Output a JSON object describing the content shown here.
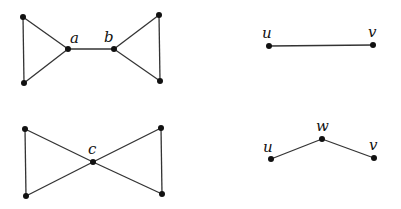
{
  "figure": {
    "graphs": [
      {
        "id": "bowtie-bridge",
        "labels": {
          "a": "a",
          "b": "b"
        }
      },
      {
        "id": "bowtie-cut",
        "labels": {
          "c": "c"
        }
      },
      {
        "id": "single-edge",
        "labels": {
          "u": "u",
          "v": "v"
        }
      },
      {
        "id": "path-two-edges",
        "labels": {
          "u": "u",
          "w": "w",
          "v": "v"
        }
      }
    ],
    "colors": {
      "edge": "#333333",
      "node": "#111111",
      "background": "#ffffff"
    }
  }
}
